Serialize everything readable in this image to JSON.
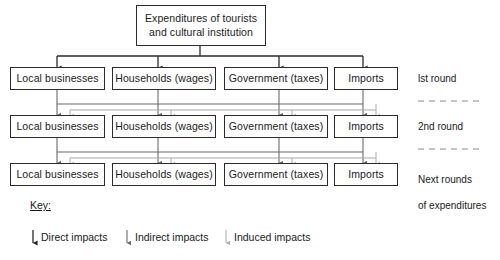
{
  "diagram": {
    "title": "Expenditures of tourists and cultural institution",
    "title_line1": "Expenditures of tourists",
    "title_line2": "and cultural institution",
    "colors": {
      "box_border": "#2b2b2b",
      "text": "#1a1a1a",
      "direct_arrow": "#2b2b2b",
      "indirect_arrow": "#6b6b6b",
      "induced_arrow": "#a9a9a9",
      "separator": "#8c8c8c",
      "background": "#ffffff"
    },
    "rows": [
      {
        "round_label": "lst round",
        "nodes": [
          {
            "label": "Local businesses"
          },
          {
            "label": "Households (wages)"
          },
          {
            "label": "Government (taxes)"
          },
          {
            "label": "Imports"
          }
        ]
      },
      {
        "round_label": "2nd round",
        "nodes": [
          {
            "label": "Local businesses"
          },
          {
            "label": "Households (wages)"
          },
          {
            "label": "Government (taxes)"
          },
          {
            "label": "Imports"
          }
        ]
      },
      {
        "round_label": "Next rounds\nof expenditures",
        "round_label_line1": "Next rounds",
        "round_label_line2": "of expenditures",
        "nodes": [
          {
            "label": "Local businesses"
          },
          {
            "label": "Households (wages)"
          },
          {
            "label": "Government (taxes)"
          },
          {
            "label": "Imports"
          }
        ]
      }
    ],
    "separators": [
      {
        "name": "separator-after-round-1"
      },
      {
        "name": "separator-after-round-2"
      }
    ],
    "key": {
      "title": "Key:",
      "entries": [
        {
          "label": "Direct impacts",
          "icon": "down-arrow-icon",
          "weight": "direct"
        },
        {
          "label": "Indirect impacts",
          "icon": "down-arrow-icon",
          "weight": "indirect"
        },
        {
          "label": "Induced impacts",
          "icon": "down-arrow-icon",
          "weight": "induced"
        }
      ]
    }
  }
}
